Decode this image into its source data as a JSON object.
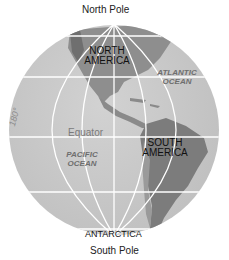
{
  "figure": {
    "type": "globe-hemisphere-map",
    "labels": {
      "north_pole": "North Pole",
      "south_pole": "South Pole",
      "north_america": [
        "NORTH",
        "AMERICA"
      ],
      "south_america": [
        "SOUTH",
        "AMERICA"
      ],
      "antarctica": "ANTARCTICA",
      "atlantic_ocean": [
        "ATLANTIC",
        "OCEAN"
      ],
      "pacific_ocean": [
        "PACIFIC",
        "OCEAN"
      ],
      "equator": "Equator",
      "meridian_180": "180°"
    },
    "colors": {
      "ocean": "#c9c9c9",
      "land": "#8c8c8c",
      "land_dark": "#6a6a6a",
      "grid": "#ffffff",
      "background": "#ffffff"
    }
  }
}
